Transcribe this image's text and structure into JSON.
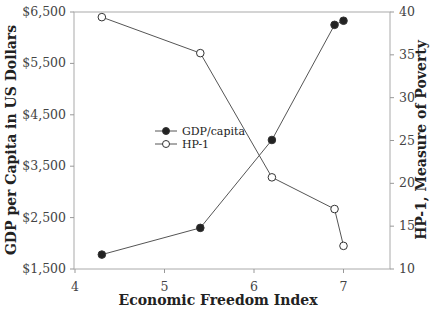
{
  "chart_data": {
    "type": "line",
    "title": "",
    "xlabel": "Economic Freedom Index",
    "ylabel": "GDP per Capita in US Dollars",
    "y2label": "HP-1, Measure of Poverty",
    "xlim": [
      4,
      7.5
    ],
    "ylim": [
      1500,
      6500
    ],
    "y2lim": [
      10,
      40
    ],
    "x_ticks": [
      "4",
      "5",
      "6",
      "7"
    ],
    "y_ticks": [
      "$1,500",
      "$2,500",
      "$3,500",
      "$4,500",
      "$5,500",
      "$6,500"
    ],
    "y2_ticks": [
      "10",
      "15",
      "20",
      "25",
      "30",
      "35",
      "40"
    ],
    "grid": false,
    "legend_position": "inside-left-middle",
    "series": [
      {
        "name": "GDP/capita",
        "axis": "left",
        "marker": "filled-circle",
        "x": [
          4.3,
          5.4,
          6.2,
          6.9,
          7.0
        ],
        "values": [
          1780,
          2300,
          4010,
          6250,
          6330
        ]
      },
      {
        "name": "HP-1",
        "axis": "right",
        "marker": "open-circle",
        "x": [
          4.3,
          5.4,
          6.2,
          6.9,
          7.0
        ],
        "values": [
          39.4,
          35.2,
          20.7,
          17.0,
          12.7
        ]
      }
    ]
  }
}
